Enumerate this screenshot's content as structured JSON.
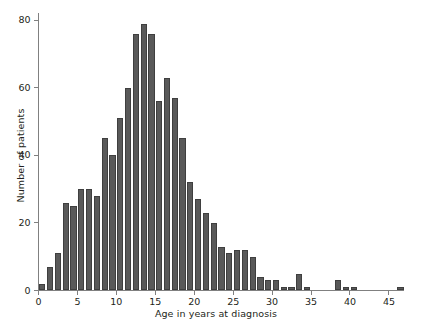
{
  "chart_data": {
    "type": "bar",
    "title": "",
    "subtitle": "",
    "xlabel": "Age in years at diagnosis",
    "ylabel": "Number of patients",
    "xlim": [
      0,
      47
    ],
    "ylim": [
      0,
      82
    ],
    "grid": false,
    "legend": null,
    "bin_width": 1,
    "bar_color": "#595959",
    "bar_edge_color": "#3f3f3f",
    "axis_color": "#808080",
    "text_color": "#231f20",
    "xticks": [
      0,
      5,
      10,
      15,
      20,
      25,
      30,
      35,
      40,
      45
    ],
    "xtick_labels": [
      "0",
      "5",
      "10",
      "15",
      "20",
      "25",
      "30",
      "35",
      "40",
      "45"
    ],
    "yticks": [
      0,
      20,
      40,
      60,
      80
    ],
    "ytick_labels": [
      "0",
      "20",
      "40",
      "60",
      "80"
    ],
    "categories": [
      "0",
      "1",
      "2",
      "3",
      "4",
      "5",
      "6",
      "7",
      "8",
      "9",
      "10",
      "11",
      "12",
      "13",
      "14",
      "15",
      "16",
      "17",
      "18",
      "19",
      "20",
      "21",
      "22",
      "23",
      "24",
      "25",
      "26",
      "27",
      "28",
      "29",
      "30",
      "31",
      "32",
      "33",
      "34",
      "35",
      "36",
      "37",
      "38",
      "39",
      "40",
      "41",
      "42",
      "43",
      "44",
      "45",
      "46"
    ],
    "values": [
      2,
      7,
      11,
      26,
      25,
      30,
      30,
      28,
      45,
      40,
      51,
      60,
      76,
      79,
      76,
      56,
      63,
      57,
      45,
      32,
      27,
      23,
      20,
      13,
      11,
      12,
      12,
      10,
      4,
      3,
      3,
      1,
      1,
      5,
      1,
      0,
      0,
      0,
      3,
      1,
      1,
      0,
      0,
      0,
      0,
      0,
      1
    ]
  }
}
